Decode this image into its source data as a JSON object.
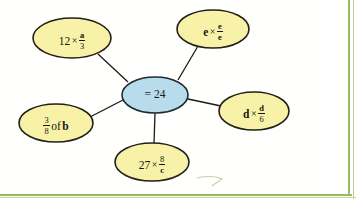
{
  "page": {
    "background_color": "#ffffff",
    "frame_color": "#9aba62"
  },
  "diagram": {
    "type": "spider-diagram",
    "center": {
      "name": "center-node",
      "text": "= 24",
      "fill_color": "#b9dcec",
      "stroke_color": "#1d2b33",
      "cx": 155,
      "cy": 95,
      "rx": 33,
      "ry": 18
    },
    "leaf_fill_color": "#f7f2a8",
    "leaf_stroke_color": "#211f18",
    "nodes": [
      {
        "id": "node-a",
        "name": "bubble-12-times-a-over-3",
        "expression": "12 × a/3",
        "whole": "12",
        "operator": "×",
        "numerator": "a",
        "denominator": "3",
        "numerator_bold": true,
        "denominator_bold": false,
        "cx": 72,
        "cy": 38,
        "rx": 39,
        "ry": 20
      },
      {
        "id": "node-e",
        "name": "bubble-e-times-e-over-e",
        "expression": "e × e/e",
        "whole": "e",
        "operator": "×",
        "numerator": "e",
        "denominator": "e",
        "whole_bold": true,
        "numerator_bold": true,
        "denominator_bold": true,
        "cx": 213,
        "cy": 29,
        "rx": 36,
        "ry": 19
      },
      {
        "id": "node-d",
        "name": "bubble-d-times-d-over-6",
        "expression": "d × d/6",
        "whole": "d",
        "operator": "×",
        "numerator": "d",
        "denominator": "6",
        "whole_bold": true,
        "numerator_bold": true,
        "denominator_bold": false,
        "cx": 254,
        "cy": 111,
        "rx": 35,
        "ry": 19
      },
      {
        "id": "node-c",
        "name": "bubble-27-times-8-over-c",
        "expression": "27 × 8/c",
        "whole": "27",
        "operator": "×",
        "numerator": "8",
        "denominator": "c",
        "numerator_bold": false,
        "denominator_bold": true,
        "cx": 152,
        "cy": 162,
        "rx": 37,
        "ry": 19
      },
      {
        "id": "node-b",
        "name": "bubble-3-over-8-of-b",
        "expression": "3/8 of b",
        "numerator": "3",
        "denominator": "8",
        "word": "of",
        "variable": "b",
        "variable_bold": true,
        "cx": 56,
        "cy": 123,
        "rx": 37,
        "ry": 19
      }
    ],
    "connectors": [
      {
        "name": "connector-center-to-a",
        "from": "center",
        "to": "node-a"
      },
      {
        "name": "connector-center-to-e",
        "from": "center",
        "to": "node-e"
      },
      {
        "name": "connector-center-to-d",
        "from": "center",
        "to": "node-d"
      },
      {
        "name": "connector-center-to-c",
        "from": "center",
        "to": "node-c"
      },
      {
        "name": "connector-center-to-b",
        "from": "center",
        "to": "node-b"
      }
    ],
    "annotation": {
      "name": "pencil-scribble-mark",
      "description": "faint hand-drawn check mark"
    }
  }
}
